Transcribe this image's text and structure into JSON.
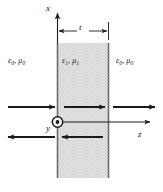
{
  "figure": {
    "type": "physics-diagram",
    "background_color": "#ffffff",
    "line_color": "#1a1a1a",
    "slab_fill_color": "#dcdcdc"
  },
  "axes": {
    "x_label": "x",
    "y_label": "y",
    "z_label": "z",
    "origin_marker": "circle-dot-out-of-page"
  },
  "dimension": {
    "label": "t",
    "description": "slab thickness"
  },
  "media": {
    "left": {
      "epsilon": "ε",
      "epsilon_sub": "0",
      "mu": "μ",
      "mu_sub": "0",
      "separator": ", "
    },
    "slab": {
      "epsilon": "ε",
      "epsilon_sub": "1",
      "mu": "μ",
      "mu_sub": "1",
      "separator": ", "
    },
    "right": {
      "epsilon": "ε",
      "epsilon_sub": "0",
      "mu": "μ",
      "mu_sub": "0",
      "separator": ", "
    }
  },
  "waves": [
    {
      "name": "incident",
      "region": "left",
      "direction": "right",
      "row": "upper"
    },
    {
      "name": "reflected",
      "region": "left",
      "direction": "left",
      "row": "lower"
    },
    {
      "name": "internal-forward",
      "region": "slab",
      "direction": "right",
      "row": "upper"
    },
    {
      "name": "internal-backward",
      "region": "slab",
      "direction": "left",
      "row": "lower"
    },
    {
      "name": "transmitted",
      "region": "right",
      "direction": "right",
      "row": "upper"
    }
  ],
  "geometry": {
    "slab_left_x": 57,
    "slab_right_x": 109,
    "slab_top_y": 43,
    "slab_bottom_y": 178,
    "axis_row_y": 122,
    "upper_row_y": 107,
    "lower_row_y": 137
  }
}
